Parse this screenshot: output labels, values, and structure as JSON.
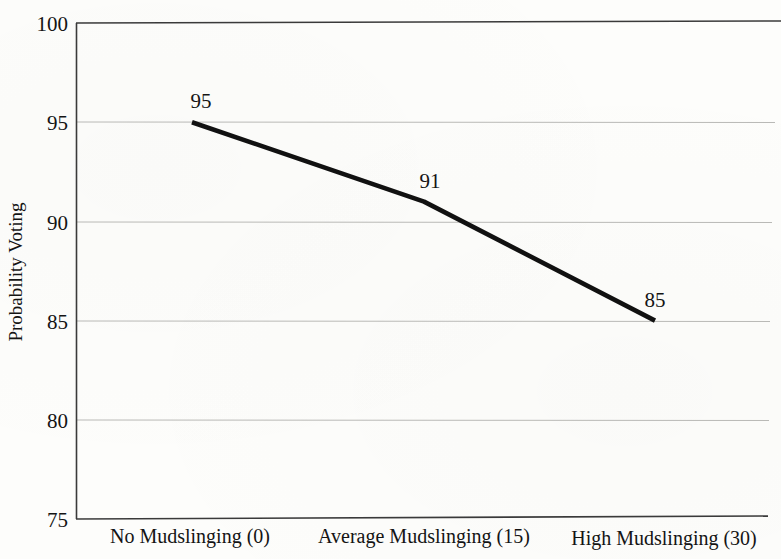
{
  "chart_data": {
    "type": "line",
    "title": "",
    "xlabel": "",
    "ylabel": "Probability Voting",
    "categories": [
      "No Mudslinging (0)",
      "Average Mudslinging (15)",
      "High Mudslinging (30)"
    ],
    "x": [
      0,
      15,
      30
    ],
    "values": [
      95,
      91,
      85
    ],
    "point_labels": [
      "95",
      "91",
      "85"
    ],
    "ylim": [
      75,
      100
    ],
    "ytick_labels": [
      "100",
      "95",
      "90",
      "85",
      "80",
      "75"
    ],
    "ytick_values": [
      100,
      95,
      90,
      85,
      80,
      75
    ],
    "grid": true,
    "legend": "none",
    "series": [
      {
        "name": "Probability Voting",
        "values": [
          95,
          91,
          85
        ]
      }
    ],
    "colors": {
      "line": "#111111",
      "grid": "#b9b9b6",
      "axis": "#3a3a3a",
      "text": "#141414",
      "background": "#fdfdfb"
    }
  },
  "axes": {
    "y_axis_title": "Probability Voting",
    "y_ticks": [
      {
        "label": "100",
        "value": 100
      },
      {
        "label": "95",
        "value": 95
      },
      {
        "label": "90",
        "value": 90
      },
      {
        "label": "85",
        "value": 85
      },
      {
        "label": "80",
        "value": 80
      },
      {
        "label": "75",
        "value": 75
      }
    ],
    "x_ticks": [
      {
        "label": "No Mudslinging (0)",
        "value": 0
      },
      {
        "label": "Average Mudslinging (15)",
        "value": 15
      },
      {
        "label": "High Mudslinging (30)",
        "value": 30
      }
    ]
  },
  "annotations": [
    {
      "label": "95",
      "x": 0,
      "y": 95
    },
    {
      "label": "91",
      "x": 15,
      "y": 91
    },
    {
      "label": "85",
      "x": 30,
      "y": 85
    }
  ]
}
